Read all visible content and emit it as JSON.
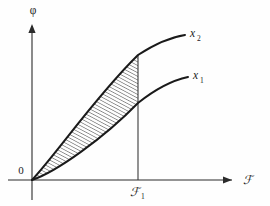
{
  "figure": {
    "title": "",
    "background_color": "#fefefe",
    "ink_color": "#1a1a1a",
    "axes": {
      "y_axis": {
        "label": "φ",
        "label_name": "phi",
        "origin_x": 32,
        "top_y": 24,
        "bottom_y": 200,
        "has_arrow": true
      },
      "x_axis": {
        "label": "ℱ",
        "label_name": "script-F",
        "baseline_y": 180,
        "left_x": 8,
        "right_x": 234,
        "has_arrow": true
      },
      "origin_label": "0"
    },
    "tick": {
      "label": "ℱ",
      "subscript": "1",
      "x_position": 138,
      "drop_line_from_y": 55,
      "drop_line_to_y": 180
    },
    "curves": [
      {
        "name": "x_2",
        "label_base": "x",
        "label_subscript": "2",
        "label_x": 190,
        "label_y": 37,
        "description": "upper concave-down curve rising from origin",
        "path": "M 32 180 C 58 152, 96 96, 138 55 C 158 42, 172 37, 185 35",
        "value_at_F1": 55
      },
      {
        "name": "x_1",
        "label_base": "x",
        "label_subscript": "1",
        "label_x": 193,
        "label_y": 79,
        "description": "lower concave-down curve rising from origin",
        "path": "M 32 180 C 56 172, 104 138, 138 103 C 158 87, 174 80, 188 77",
        "value_at_F1": 103
      }
    ],
    "shaded_region": {
      "name": "area-between-curves",
      "hatch_style": "diagonal-lines",
      "hatch_angle_deg": 62,
      "hatch_spacing_px": 3,
      "hatch_color": "#333333",
      "from_x": 32,
      "to_x": 138
    }
  }
}
